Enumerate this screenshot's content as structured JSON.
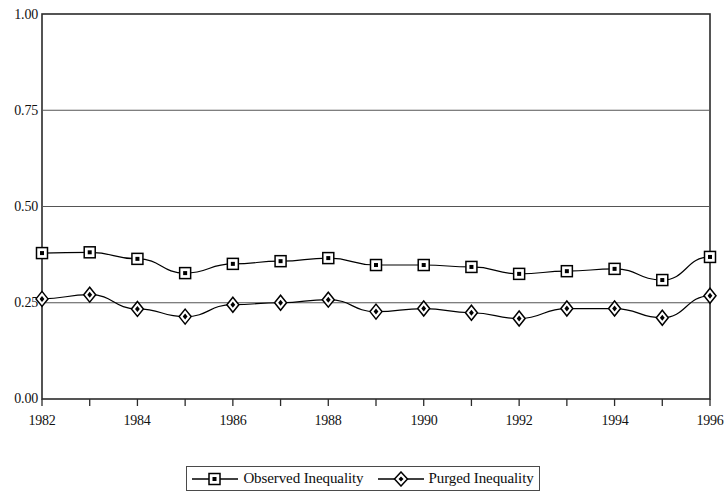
{
  "chart_data": {
    "type": "line",
    "title": "",
    "subtitle": "",
    "xlabel": "",
    "ylabel": "",
    "x": [
      1982,
      1983,
      1984,
      1985,
      1986,
      1987,
      1988,
      1989,
      1990,
      1991,
      1992,
      1993,
      1994,
      1995,
      1996
    ],
    "categories": [
      "1982",
      "1983",
      "1984",
      "1985",
      "1986",
      "1987",
      "1988",
      "1989",
      "1990",
      "1991",
      "1992",
      "1993",
      "1994",
      "1995",
      "1996"
    ],
    "series": [
      {
        "name": "Observed Inequality",
        "marker": "square",
        "color": "#000000",
        "values": [
          0.379,
          0.381,
          0.364,
          0.327,
          0.351,
          0.358,
          0.366,
          0.348,
          0.348,
          0.343,
          0.325,
          0.332,
          0.338,
          0.309,
          0.369
        ]
      },
      {
        "name": "Purged Inequality",
        "marker": "diamond",
        "color": "#000000",
        "values": [
          0.26,
          0.271,
          0.234,
          0.214,
          0.245,
          0.25,
          0.258,
          0.227,
          0.235,
          0.224,
          0.209,
          0.235,
          0.235,
          0.211,
          0.268
        ]
      }
    ],
    "ylim": [
      0.0,
      1.0
    ],
    "xlim": [
      1982,
      1996
    ],
    "yticks": [
      0.0,
      0.25,
      0.5,
      0.75,
      1.0
    ],
    "ytick_labels": [
      "0.00",
      "0.25",
      "0.50",
      "0.75",
      "1.00"
    ],
    "xticks": [
      1982,
      1983,
      1984,
      1985,
      1986,
      1987,
      1988,
      1989,
      1990,
      1991,
      1992,
      1993,
      1994,
      1995,
      1996
    ],
    "xtick_labels_shown": [
      "1982",
      "1984",
      "1986",
      "1988",
      "1990",
      "1992",
      "1994",
      "1996"
    ],
    "grid": "horizontal",
    "legend_position": "bottom"
  },
  "axis": {
    "y_labels": [
      "1.00",
      "0.75",
      "0.50",
      "0.25",
      "0.00"
    ],
    "x_labels": [
      "1982",
      "1984",
      "1986",
      "1988",
      "1990",
      "1992",
      "1994",
      "1996"
    ]
  },
  "legend": {
    "items": [
      {
        "label": "Observed Inequality",
        "marker": "square"
      },
      {
        "label": "Purged Inequality",
        "marker": "diamond"
      }
    ]
  }
}
